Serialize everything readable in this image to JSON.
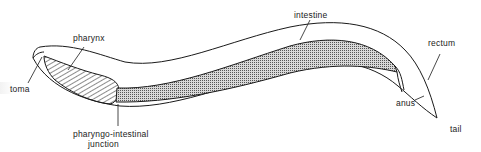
{
  "diagram": {
    "colors": {
      "line": "#1a1a1a",
      "background": "#ffffff",
      "intestine_fill": "#b8b8b8"
    },
    "labels": {
      "stoma": "toma",
      "pharynx": "pharynx",
      "junction_line1": "pharyngo-intestinal",
      "junction_line2": "junction",
      "intestine": "intestine",
      "rectum": "rectum",
      "anus": "anus",
      "tail": "tail"
    }
  }
}
